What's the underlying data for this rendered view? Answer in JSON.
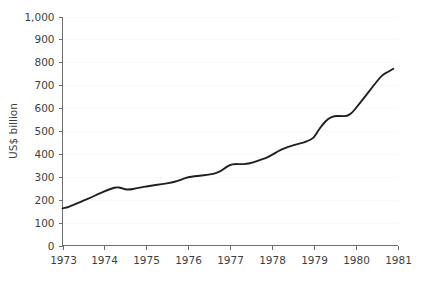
{
  "chart_data": {
    "type": "line",
    "title": "",
    "subtitle": "",
    "xlabel": "",
    "ylabel": "US$ billion",
    "xlim": [
      1973,
      1981
    ],
    "ylim": [
      0,
      1000
    ],
    "grid": "faint-horizontal",
    "legend": "none",
    "x_tick_labels": [
      "1973",
      "1974",
      "1975",
      "1976",
      "1977",
      "1978",
      "1979",
      "1980",
      "1981"
    ],
    "x_tick_values": [
      1973,
      1974,
      1975,
      1976,
      1977,
      1978,
      1979,
      1980,
      1981
    ],
    "y_tick_labels": [
      "0",
      "100",
      "200",
      "300",
      "400",
      "500",
      "600",
      "700",
      "800",
      "900",
      "1,000"
    ],
    "y_tick_values": [
      0,
      100,
      200,
      300,
      400,
      500,
      600,
      700,
      800,
      900,
      1000
    ],
    "series": [
      {
        "name": "US$ billion",
        "color": "#231f20",
        "x": [
          1973.0,
          1973.1,
          1973.2,
          1973.3,
          1973.42,
          1973.55,
          1973.68,
          1973.8,
          1973.92,
          1974.05,
          1974.18,
          1974.3,
          1974.4,
          1974.5,
          1974.62,
          1974.75,
          1974.88,
          1975.0,
          1975.15,
          1975.3,
          1975.45,
          1975.6,
          1975.75,
          1975.9,
          1976.0,
          1976.15,
          1976.3,
          1976.45,
          1976.6,
          1976.75,
          1976.88,
          1977.0,
          1977.12,
          1977.25,
          1977.4,
          1977.55,
          1977.7,
          1977.85,
          1978.0,
          1978.15,
          1978.3,
          1978.45,
          1978.6,
          1978.75,
          1978.88,
          1979.0,
          1979.1,
          1979.22,
          1979.35,
          1979.5,
          1979.65,
          1979.8,
          1979.92,
          1980.05,
          1980.2,
          1980.35,
          1980.5,
          1980.65,
          1980.78,
          1980.9
        ],
        "y": [
          162,
          166,
          172,
          180,
          190,
          200,
          210,
          220,
          230,
          240,
          249,
          255,
          252,
          244,
          245,
          249,
          254,
          258,
          262,
          266,
          270,
          275,
          282,
          292,
          298,
          302,
          305,
          308,
          313,
          322,
          338,
          353,
          356,
          355,
          356,
          362,
          372,
          382,
          395,
          412,
          425,
          434,
          442,
          450,
          458,
          470,
          500,
          530,
          555,
          566,
          565,
          565,
          580,
          610,
          645,
          680,
          715,
          748,
          758,
          772
        ]
      }
    ],
    "annotations": {
      "start_value": 162,
      "end_value": 920,
      "peak_1974": 255,
      "dip_1974": 243,
      "plateau_1977": 355,
      "plateau_1979": 565
    }
  },
  "axis": {
    "y_axis_title": "US$ billion"
  }
}
